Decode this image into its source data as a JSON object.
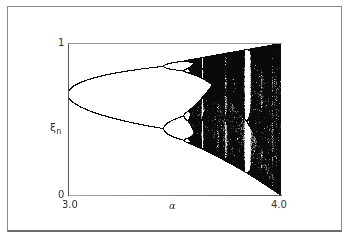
{
  "chart_data": {
    "type": "scatter",
    "title": "",
    "xlabel": "α",
    "ylabel": "ξn",
    "ylabel_main": "ξ",
    "ylabel_sub": "n",
    "xlim": [
      3.0,
      4.0
    ],
    "ylim": [
      0,
      1
    ],
    "x_ticks": [
      "3.0",
      "4.0"
    ],
    "y_ticks": [
      "0",
      "1"
    ],
    "grid": false,
    "legend": null,
    "features": {
      "period_doubling_1": {
        "alpha": 3.0,
        "xi": 0.667
      },
      "period_doubling_2": {
        "alpha": 3.449,
        "xi_branches": [
          0.44,
          0.85
        ]
      },
      "period_doubling_3": {
        "alpha": 3.544
      },
      "onset_of_chaos": {
        "alpha": 3.57
      },
      "period_3_window": {
        "alpha_range": [
          3.828,
          3.857
        ]
      },
      "upper_envelope_at_4": 1.0,
      "lower_envelope_at_4": 0.0
    },
    "point_color": "#111111",
    "background": "#ffffff"
  },
  "axes": {
    "x_tick_left": "3.0",
    "x_tick_right": "4.0",
    "x_label": "α",
    "y_tick_top": "1",
    "y_tick_bottom": "0",
    "y_label_main": "ξ",
    "y_label_sub": "n"
  }
}
